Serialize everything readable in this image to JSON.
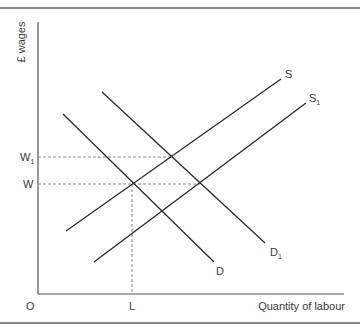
{
  "diagram": {
    "y_axis_label": "£ wages",
    "x_axis_label": "Quantity of labour",
    "origin_label": "O",
    "x_marks": [
      {
        "label": "L"
      }
    ],
    "y_marks": [
      {
        "label": "W",
        "sub": ""
      },
      {
        "label": "W",
        "sub": "1"
      }
    ],
    "curves": [
      {
        "name": "D",
        "label": "D",
        "sub": ""
      },
      {
        "name": "D1",
        "label": "D",
        "sub": "1"
      },
      {
        "name": "S",
        "label": "S",
        "sub": ""
      },
      {
        "name": "S1",
        "label": "S",
        "sub": "1"
      }
    ],
    "colors": {
      "line": "#2a2a2a",
      "dashed": "#8a8a8a",
      "frame": "#8a8a8a",
      "text": "#3a3a3a"
    }
  }
}
